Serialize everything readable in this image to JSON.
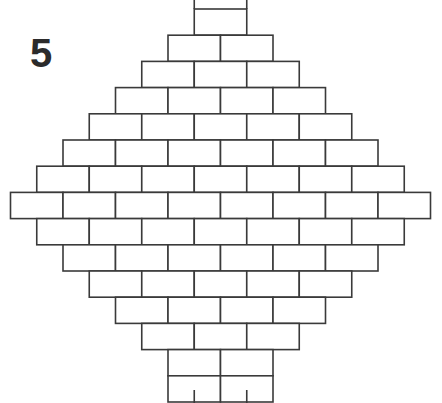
{
  "figure": {
    "label": "5",
    "type": "diagram",
    "width": 442,
    "height": 403,
    "background_color": "#ffffff",
    "line_color": "#3a3a3a",
    "brick_fill": "#ffffff",
    "label_color": "#2b2b2b"
  },
  "geometry": {
    "brick_width": 52.5,
    "brick_height": 26.2,
    "half_brick": 26.25,
    "center_x": 220.5,
    "widest_row_left": 10,
    "widest_row_right": 430,
    "row_count": 15,
    "max_bricks_per_row": 8,
    "first_full_row_top": 9,
    "stub_length_top": 9,
    "stub_length_bottom": 13
  },
  "rows": [
    {
      "index": 0,
      "bricks": 1,
      "left": 194.25,
      "top": 9.0,
      "offset_half": true
    },
    {
      "index": 1,
      "bricks": 2,
      "left": 168.0,
      "top": 35.2,
      "offset_half": false
    },
    {
      "index": 2,
      "bricks": 3,
      "left": 141.75,
      "top": 61.4,
      "offset_half": true
    },
    {
      "index": 3,
      "bricks": 4,
      "left": 115.5,
      "top": 87.6,
      "offset_half": false
    },
    {
      "index": 4,
      "bricks": 5,
      "left": 89.25,
      "top": 113.8,
      "offset_half": true
    },
    {
      "index": 5,
      "bricks": 6,
      "left": 63.0,
      "top": 140.0,
      "offset_half": false
    },
    {
      "index": 6,
      "bricks": 7,
      "left": 36.75,
      "top": 166.2,
      "offset_half": true
    },
    {
      "index": 7,
      "bricks": 8,
      "left": 10.5,
      "top": 192.4,
      "offset_half": false
    },
    {
      "index": 8,
      "bricks": 7,
      "left": 36.75,
      "top": 218.6,
      "offset_half": true
    },
    {
      "index": 9,
      "bricks": 6,
      "left": 63.0,
      "top": 244.8,
      "offset_half": false
    },
    {
      "index": 10,
      "bricks": 5,
      "left": 89.25,
      "top": 271.0,
      "offset_half": true
    },
    {
      "index": 11,
      "bricks": 4,
      "left": 115.5,
      "top": 297.2,
      "offset_half": false
    },
    {
      "index": 12,
      "bricks": 3,
      "left": 141.75,
      "top": 323.4,
      "offset_half": true
    },
    {
      "index": 13,
      "bricks": 2,
      "left": 168.0,
      "top": 349.6,
      "offset_half": false
    },
    {
      "index": 14,
      "bricks": 2,
      "left": 168.0,
      "top": 375.8,
      "offset_half": false
    }
  ],
  "top_stubs": {
    "count": 2,
    "x_positions": [
      194.25,
      246.75
    ],
    "y_start": 0,
    "y_end": 9
  },
  "bottom_stubs": {
    "count": 2,
    "x_positions": [
      194.25,
      246.75
    ],
    "y_start": 390,
    "y_end": 403
  },
  "bottom_partial_row": {
    "bricks": 2,
    "left": 168.0,
    "top": 375.8,
    "clipped": true,
    "note": "bottom row is cut off by the image edge"
  }
}
